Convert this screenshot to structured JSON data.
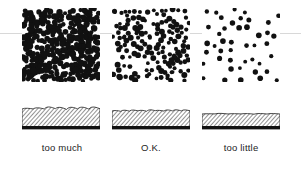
{
  "figure": {
    "name": "speckle-density-comparison-figure",
    "background": "#ffffff",
    "ink_color": "#111111",
    "width": 301,
    "height": 170,
    "scanline": {
      "y": 33,
      "color": "#d8d8d8"
    }
  },
  "columns": [
    {
      "id": "too-much",
      "caption": "too much",
      "caption_x": 23,
      "caption_y": 142,
      "caption_width": 78,
      "speckle": {
        "x": 22,
        "y": 8,
        "width": 78,
        "height": 74,
        "dot_count": 330,
        "dot_radius_min": 2.0,
        "dot_radius_max": 3.4,
        "density_label": "very dense",
        "seed": 11
      },
      "section": {
        "x": 22,
        "y": 103,
        "width": 78,
        "height": 27,
        "wave_amplitude": 2.6,
        "wave_count": 7,
        "coating_thickness": 17,
        "base_thickness": 3,
        "hatch_spacing": 3,
        "roughness_label": "heavily rippled"
      }
    },
    {
      "id": "ok",
      "caption": "O.K.",
      "caption_x": 112,
      "caption_y": 142,
      "caption_width": 78,
      "speckle": {
        "x": 112,
        "y": 8,
        "width": 78,
        "height": 74,
        "dot_count": 150,
        "dot_radius_min": 1.8,
        "dot_radius_max": 3.1,
        "density_label": "medium",
        "seed": 27
      },
      "section": {
        "x": 112,
        "y": 103,
        "width": 78,
        "height": 27,
        "wave_amplitude": 1.6,
        "wave_count": 9,
        "coating_thickness": 15,
        "base_thickness": 3,
        "hatch_spacing": 3,
        "roughness_label": "lightly rippled"
      }
    },
    {
      "id": "too-little",
      "caption": "too little",
      "caption_x": 202,
      "caption_y": 142,
      "caption_width": 78,
      "speckle": {
        "x": 202,
        "y": 8,
        "width": 78,
        "height": 74,
        "dot_count": 44,
        "dot_radius_min": 1.9,
        "dot_radius_max": 2.9,
        "density_label": "sparse",
        "seed": 43
      },
      "section": {
        "x": 202,
        "y": 103,
        "width": 78,
        "height": 27,
        "wave_amplitude": 0.8,
        "wave_count": 6,
        "coating_thickness": 12,
        "base_thickness": 3,
        "hatch_spacing": 3,
        "roughness_label": "nearly flat"
      }
    }
  ]
}
